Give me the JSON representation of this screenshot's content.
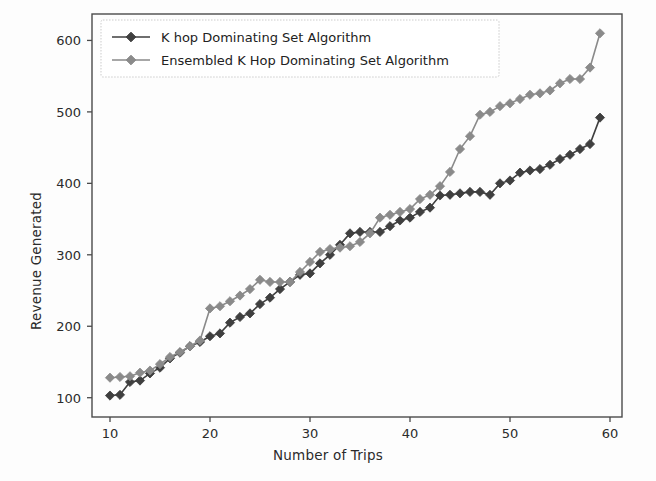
{
  "chart_data": {
    "type": "line",
    "title": "",
    "xlabel": "Number of Trips",
    "ylabel": "Revenue Generated",
    "xlim": [
      8.2,
      61.2
    ],
    "ylim": [
      73,
      637
    ],
    "xticks": [
      10,
      20,
      30,
      40,
      50,
      60
    ],
    "yticks": [
      100,
      200,
      300,
      400,
      500,
      600
    ],
    "grid": false,
    "legend_position": "upper left",
    "marker": "diamond",
    "x": [
      10,
      11,
      12,
      13,
      14,
      15,
      16,
      17,
      18,
      19,
      20,
      21,
      22,
      23,
      24,
      25,
      26,
      27,
      28,
      29,
      30,
      31,
      32,
      33,
      34,
      35,
      36,
      37,
      38,
      39,
      40,
      41,
      42,
      43,
      44,
      45,
      46,
      47,
      48,
      49,
      50,
      51,
      52,
      53,
      54,
      55,
      56,
      57,
      58,
      59
    ],
    "series": [
      {
        "name": "K hop Dominating Set Algorithm",
        "color": "#3f3f3f",
        "values": [
          103,
          104,
          122,
          124,
          134,
          142,
          155,
          163,
          172,
          178,
          186,
          190,
          205,
          213,
          218,
          231,
          240,
          252,
          262,
          272,
          274,
          288,
          300,
          314,
          330,
          332,
          332,
          332,
          340,
          348,
          352,
          360,
          366,
          383,
          384,
          386,
          388,
          388,
          384,
          400,
          404,
          415,
          418,
          420,
          426,
          434,
          440,
          448,
          455,
          492
        ]
      },
      {
        "name": "Ensembled K Hop Dominating Set Algorithm",
        "color": "#8a8a8a",
        "values": [
          128,
          129,
          130,
          135,
          138,
          147,
          157,
          164,
          172,
          180,
          225,
          228,
          235,
          243,
          252,
          265,
          262,
          262,
          262,
          276,
          290,
          304,
          308,
          310,
          312,
          318,
          330,
          352,
          356,
          360,
          364,
          378,
          384,
          396,
          416,
          448,
          466,
          496,
          500,
          508,
          512,
          518,
          524,
          526,
          530,
          540,
          546,
          546,
          562,
          610
        ]
      }
    ]
  },
  "legend": {
    "entries": [
      {
        "label": "K hop Dominating Set Algorithm"
      },
      {
        "label": "Ensembled K Hop Dominating Set Algorithm"
      }
    ]
  }
}
